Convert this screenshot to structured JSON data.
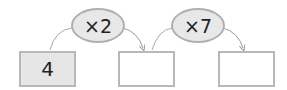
{
  "diagram": {
    "boxes": [
      {
        "value": "4",
        "filled": true
      },
      {
        "value": "",
        "filled": false
      },
      {
        "value": "",
        "filled": false
      }
    ],
    "operators": [
      {
        "label": "×2"
      },
      {
        "label": "×7"
      }
    ],
    "colors": {
      "box_border": "#b8b8b8",
      "filled_box": "#e6e6e6",
      "oval_fill": "#e8e8e8",
      "arrow": "#999999"
    }
  }
}
